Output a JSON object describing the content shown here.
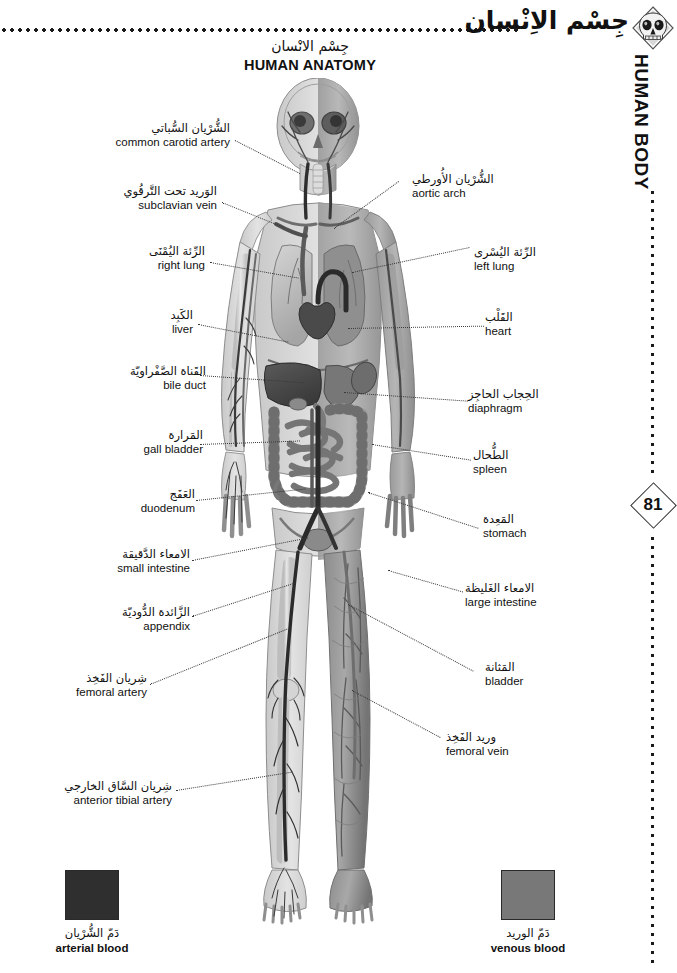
{
  "header": {
    "title_ar": "جِسْم الاِنْسان",
    "rule_icon": "dotted-rule",
    "emblem_icon": "skull-icon"
  },
  "sidebar": {
    "section_label": "HUMAN BODY",
    "page_number": "81",
    "dots_icon": "dotted-line"
  },
  "title": {
    "ar": "جِسْم الانْسان",
    "en": "HUMAN ANATOMY"
  },
  "figure": {
    "name": "human-anatomy-illustration"
  },
  "labels_left": [
    {
      "ar": "الشُّرْيان السُّباتي",
      "en": "common carotid artery"
    },
    {
      "ar": "الوَريد تحت التَّرقُوي",
      "en": "subclavian vein"
    },
    {
      "ar": "الرِّئة اليُمْنَى",
      "en": "right lung"
    },
    {
      "ar": "الكَبِد",
      "en": "liver"
    },
    {
      "ar": "القَناة الصَّفْراويّة",
      "en": "bile duct"
    },
    {
      "ar": "المَرارة",
      "en": "gall bladder"
    },
    {
      "ar": "العَفَج",
      "en": "duodenum"
    },
    {
      "ar": "الامعاء الدَّقيقة",
      "en": "small intestine"
    },
    {
      "ar": "الزَّائدة الدُّوديّة",
      "en": "appendix"
    },
    {
      "ar": "شِريان الفَخِذ",
      "en": "femoral artery"
    },
    {
      "ar": "شِريان السَّاق الخارجي",
      "en": "anterior tibial artery"
    }
  ],
  "labels_right": [
    {
      "ar": "الشُّرْيان الأُورطي",
      "en": "aortic arch"
    },
    {
      "ar": "الرِّئة اليُسْرى",
      "en": "left lung"
    },
    {
      "ar": "القَلْب",
      "en": "heart"
    },
    {
      "ar": "الحِجاب الحاجِز",
      "en": "diaphragm"
    },
    {
      "ar": "الطُّحال",
      "en": "spleen"
    },
    {
      "ar": "المَعِدة",
      "en": "stomach"
    },
    {
      "ar": "الامعاء الغَليظة",
      "en": "large intestine"
    },
    {
      "ar": "المَثانة",
      "en": "bladder"
    },
    {
      "ar": "وريد الفَخِذ",
      "en": "femoral vein"
    }
  ],
  "legend": [
    {
      "ar": "دَمّ الشُّرْيان",
      "en": "arterial blood",
      "color": "#2f2f2f"
    },
    {
      "ar": "دَمّ الوريد",
      "en": "venous blood",
      "color": "#787878"
    }
  ],
  "colors": {
    "ink": "#111111",
    "leader": "#3a3a3a",
    "paper": "#ffffff"
  }
}
